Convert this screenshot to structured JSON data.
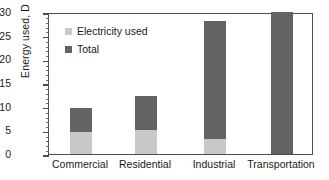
{
  "chart_data": {
    "type": "bar",
    "title": "",
    "subtitle": "",
    "xlabel": "",
    "ylabel": "Energy used, D",
    "categories": [
      "Commercial",
      "Residential",
      "Industrial",
      "Transportation"
    ],
    "series": [
      {
        "name": "Electricity used",
        "color": "#c8c8c8",
        "values": [
          4.7,
          5.0,
          3.2,
          0.0
        ]
      },
      {
        "name": "Total",
        "color": "#636363",
        "values": [
          9.7,
          12.3,
          28.0,
          29.9
        ]
      }
    ],
    "stacking": "overlay-total-with-electricity-subset",
    "ylim": [
      0,
      30
    ],
    "yticks": [
      0,
      5,
      10,
      15,
      20,
      25,
      30
    ],
    "ytick_labels": [
      "0",
      "5",
      "10",
      "15",
      "20",
      "25",
      "30"
    ],
    "minor_ticks_per_interval": 5,
    "grid": false,
    "legend_position": "upper-left-inside",
    "legend": [
      {
        "label": "Electricity used",
        "color": "#c8c8c8"
      },
      {
        "label": "Total",
        "color": "#636363"
      }
    ],
    "axis_color": "#4d4d4d",
    "background": "#ffffff"
  }
}
